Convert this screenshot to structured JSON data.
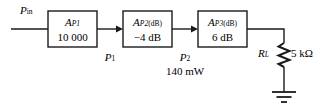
{
  "diagram": {
    "type": "block-diagram",
    "input": {
      "label_symbol": "P",
      "label_sub": "in",
      "name": "P-in"
    },
    "stages": [
      {
        "id": "stage-1",
        "symbol": "A",
        "symbol_sub": "P1",
        "value": "10 000",
        "value_unit": "",
        "x": 48,
        "y": 11,
        "w": 49,
        "h": 36
      },
      {
        "id": "stage-2",
        "symbol": "A",
        "symbol_sub": "P2",
        "symbol_sub2": "(dB)",
        "value": "−4 dB",
        "x": 123,
        "y": 11,
        "w": 49,
        "h": 36
      },
      {
        "id": "stage-3",
        "symbol": "A",
        "symbol_sub": "P3",
        "symbol_sub2": "(dB)",
        "value": "6 dB",
        "x": 198,
        "y": 11,
        "w": 49,
        "h": 36
      }
    ],
    "nodes": [
      {
        "id": "node-p1",
        "symbol": "P",
        "sub": "1",
        "value": "",
        "x": 110,
        "y": 52
      },
      {
        "id": "node-p2",
        "symbol": "P",
        "sub": "2",
        "value": "140 mW",
        "x": 185,
        "y": 52
      }
    ],
    "load": {
      "symbol": "R",
      "sub": "L",
      "value": "5 kΩ",
      "name": "load-resistor"
    },
    "ground": {
      "name": "ground-symbol",
      "bars": 3
    },
    "colors": {
      "stroke": "#1a1a1a",
      "text": "#000000",
      "background": "#ffffff"
    }
  }
}
